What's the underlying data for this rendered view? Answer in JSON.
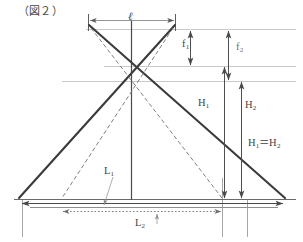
{
  "figure": {
    "caption": "（図２）",
    "kind": "geometry-diagram"
  },
  "labels": {
    "ell": "ℓ",
    "f1_base": "f",
    "f1_sub": "1",
    "f2_base": "f",
    "f2_sub": "2",
    "h1_base": "H",
    "h1_sub": "1",
    "h2_base": "H",
    "h2_sub": "2",
    "l1_base": "L",
    "l1_sub": "1",
    "l2_base": "L",
    "l2_sub": "2",
    "equality_left": "H",
    "equality_left_sub": "1",
    "equality_sign": "＝",
    "equality_right": "H",
    "equality_right_sub": "2"
  },
  "colors": {
    "ink": "#3a3a3a",
    "solid_line": "#3d3d3d",
    "dashed_line": "#6a6a6a",
    "thin_reference": "#b9b9b9",
    "arrow": "#4a4a4a",
    "background": "#ffffff",
    "leader": "#9a9a9a"
  },
  "geometry": {
    "sensor_left_x": 88,
    "sensor_right_x": 175,
    "sensor_top_y": 18,
    "lens_plane_y": 29,
    "cross_solid_y": 66,
    "cross_dashed_y": 81,
    "baseline_y": 199,
    "baseline_left_x": 18,
    "baseline_right_x": 285,
    "apex_x": 131,
    "h1_arrow_x": 224,
    "h2_arrow_x": 240,
    "l2_left_x": 62,
    "l2_right_x": 222
  },
  "measurements": [
    {
      "name": "ℓ",
      "role": "sensor-width",
      "orientation": "horizontal",
      "style": "double-arrow"
    },
    {
      "name": "f1",
      "role": "focal-length-short",
      "orientation": "vertical",
      "style": "double-arrow"
    },
    {
      "name": "f2",
      "role": "focal-length-long",
      "orientation": "vertical",
      "style": "double-arrow"
    },
    {
      "name": "H1",
      "role": "height-short-lens",
      "orientation": "vertical",
      "style": "double-arrow"
    },
    {
      "name": "H2",
      "role": "height-long-lens",
      "orientation": "vertical",
      "style": "double-arrow"
    },
    {
      "name": "L1",
      "role": "ground-coverage-solid",
      "orientation": "horizontal",
      "style": "double-arrow"
    },
    {
      "name": "L2",
      "role": "ground-coverage-dashed",
      "orientation": "horizontal",
      "style": "dotted-double-arrow"
    }
  ]
}
